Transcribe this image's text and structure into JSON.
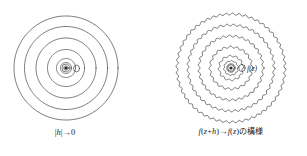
{
  "page": {
    "width": 307,
    "height": 156,
    "background": "#ffffff",
    "ink_color": "#2b2b2b",
    "text_color": "#1d1d1d"
  },
  "figures": [
    {
      "id": "smooth-rings",
      "name": "left-figure",
      "style": "smooth",
      "center": {
        "x": 66,
        "y": 68
      },
      "ring_radii": [
        52,
        41.5,
        30,
        18.5,
        9.5,
        5.5,
        2.2
      ],
      "ring_count": 7,
      "core": {
        "dot_radius": 1.6,
        "inner_circle_radius": 4.0,
        "satellite": {
          "dx": 10.5,
          "dy": 0.5,
          "rx": 3.0,
          "ry": 3.4
        }
      },
      "wave": {
        "amplitude": 0,
        "lobes": 0
      },
      "caption": {
        "raw": "|h| → 0",
        "parts": [
          {
            "text": "|",
            "kind": "plain"
          },
          {
            "text": "h",
            "kind": "math"
          },
          {
            "text": "|",
            "kind": "plain"
          },
          {
            "text": "→",
            "kind": "arrow"
          },
          {
            "text": "0",
            "kind": "plain"
          }
        ]
      }
    },
    {
      "id": "wavy-rings",
      "name": "right-figure",
      "style": "wavy",
      "center": {
        "x": 227,
        "y": 68
      },
      "ring_radii": [
        54,
        43,
        32,
        21,
        12,
        7,
        3.2
      ],
      "ring_count": 7,
      "core": {
        "dot_radius": 1.6,
        "inner_circle_radius": 4.2,
        "satellite": {
          "dx": 11.0,
          "dy": 0.0,
          "rx": 3.2,
          "ry": 3.6
        }
      },
      "wave": {
        "amplitude": 1.0,
        "lobes": 52
      },
      "inline_label": {
        "text": "f(z)",
        "x": 243,
        "y": 71
      },
      "caption": {
        "raw": "f(z+h) → f(z) の模様",
        "parts": [
          {
            "text": "f",
            "kind": "math"
          },
          {
            "text": "(",
            "kind": "plain"
          },
          {
            "text": "z",
            "kind": "math"
          },
          {
            "text": "+",
            "kind": "plain"
          },
          {
            "text": "h",
            "kind": "math"
          },
          {
            "text": ")",
            "kind": "plain"
          },
          {
            "text": "→",
            "kind": "arrow"
          },
          {
            "text": "f",
            "kind": "math"
          },
          {
            "text": "(",
            "kind": "plain"
          },
          {
            "text": "z",
            "kind": "math"
          },
          {
            "text": ")",
            "kind": "plain"
          },
          {
            "text": "の模様",
            "kind": "jp"
          }
        ]
      }
    }
  ],
  "captions": {
    "left": "|h|→0",
    "right": "f(z+h)→f(z) の模様"
  },
  "labels": {
    "right_inline": "f(z)"
  }
}
